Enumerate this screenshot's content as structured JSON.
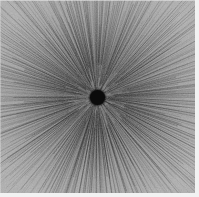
{
  "figure": {
    "width": 199,
    "height": 197,
    "background_color": "#8d8d8d",
    "margin_color": "#f2f2f2"
  },
  "chart_data": {
    "type": "scatter",
    "subtitle": "",
    "xlabel": "",
    "ylabel": "",
    "grid": false,
    "legend_position": "none",
    "axis_visible": false,
    "tick_labels_x": [],
    "tick_labels_y": [],
    "xlim": [
      0,
      195
    ],
    "ylim": [
      0,
      193
    ],
    "origin": {
      "x": 97,
      "y": 97
    },
    "center_disc": {
      "center_x": 97,
      "center_y": 97,
      "radius": 7.5,
      "fill_color": "#0b0b0b"
    },
    "rays": {
      "count": 520,
      "angle_start_deg": 0,
      "angle_end_deg": 360,
      "angular_jitter_deg": 0.9,
      "inner_radius_min": 6,
      "inner_radius_max": 34,
      "outer_radius_min": 70,
      "outer_radius_max": 165,
      "stroke_color": "#1f1f1f",
      "stroke_width_min": 0.35,
      "stroke_width_max": 0.9,
      "opacity_min": 0.18,
      "opacity_max": 0.75
    },
    "intensity_profile": {
      "note": "mean luminance as a function of radius from origin, 0-255",
      "radii": [
        8,
        20,
        40,
        60,
        80,
        100,
        120,
        140
      ],
      "values": [
        70,
        105,
        124,
        135,
        143,
        152,
        162,
        173
      ]
    },
    "palette": {
      "background": "#8d8d8d",
      "ray_dark": "#1f1f1f",
      "core": "#0b0b0b",
      "corner_light": "#b4b4b4"
    }
  }
}
